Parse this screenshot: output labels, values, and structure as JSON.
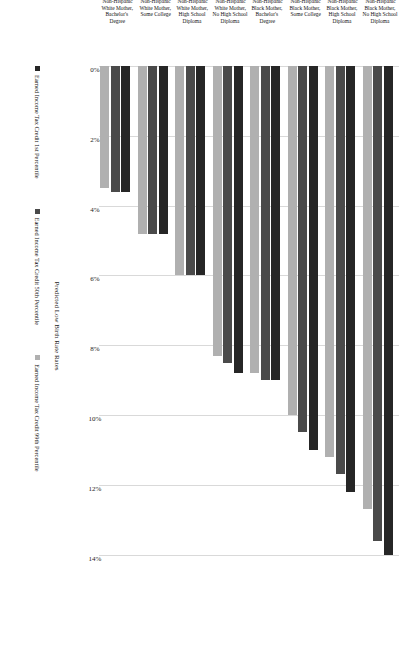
{
  "chart_data": {
    "type": "bar",
    "orientation": "horizontal",
    "title": "",
    "xlabel": "Predicted Low Birth Rate Rates",
    "ylabel": "",
    "xlim": [
      0,
      14.9
    ],
    "grid": true,
    "legend_position": "bottom",
    "tick_labels": [
      "0%",
      "2%",
      "4%",
      "6%",
      "8%",
      "10%",
      "12%",
      "14%"
    ],
    "tick_values": [
      0,
      2,
      4,
      6,
      8,
      10,
      12,
      14
    ],
    "categories": [
      "Non-Hispanic\nBlack Mother,\nNo High School\nDiploma",
      "Non-Hispanic\nBlack Mother,\nHigh School\nDiploma",
      "Non-Hispanic\nBlack Mother,\nSome College",
      "Non-Hispanic\nBlack Mother,\nBachelor's\nDegree",
      "Non-Hispanic\nWhite Mother,\nNo High School\nDiploma",
      "Non-Hispanic\nWhite Mother,\nHigh School\nDiploma",
      "Non-Hispanic\nWhite Mother,\nSome College",
      "Non-Hispanic\nWhite Mother,\nBachelor's\nDegree"
    ],
    "series": [
      {
        "name": "Earned Income Tax Credit 1st Percentile",
        "color": "#262626",
        "values": [
          14.0,
          12.2,
          11.0,
          9.0,
          8.8,
          6.0,
          4.8,
          3.6
        ]
      },
      {
        "name": "Earned Income Tax Credit 50th Percentile",
        "color": "#4a4a4a",
        "values": [
          13.6,
          11.7,
          10.5,
          9.0,
          8.5,
          6.0,
          4.8,
          3.6
        ]
      },
      {
        "name": "Earned Income Tax Credit 99th Percentile",
        "color": "#b0b0b0",
        "values": [
          12.7,
          11.2,
          10.0,
          8.8,
          8.3,
          6.0,
          4.8,
          3.5
        ]
      }
    ]
  }
}
